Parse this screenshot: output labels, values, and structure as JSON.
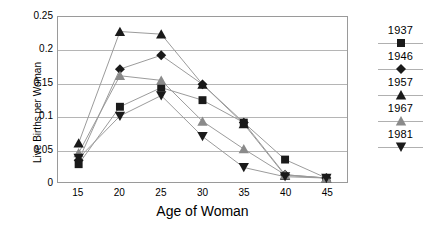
{
  "chart_data": {
    "type": "line",
    "title": "",
    "xlabel": "Age of Woman",
    "ylabel": "Live Births per Woman",
    "x": [
      15,
      20,
      25,
      30,
      35,
      40,
      45
    ],
    "xtick_labels": [
      "15",
      "20",
      "25",
      "30",
      "35",
      "40",
      "45"
    ],
    "ytick_labels": [
      "0",
      "0.05",
      "0.1",
      "0.15",
      "0.2",
      "0.25"
    ],
    "ytick_values": [
      0,
      0.05,
      0.1,
      0.15,
      0.2,
      0.25
    ],
    "xlim": [
      12.5,
      47.5
    ],
    "ylim": [
      0,
      0.25
    ],
    "grid": "horizontal",
    "legend_position": "right",
    "series": [
      {
        "name": "1937",
        "marker": "square",
        "color": "#1a1a1a",
        "values": [
          0.027,
          0.114,
          0.143,
          0.124,
          0.09,
          0.034,
          0.006
        ]
      },
      {
        "name": "1946",
        "marker": "diamond",
        "color": "#1a1a1a",
        "values": [
          0.033,
          0.171,
          0.192,
          0.148,
          0.09,
          0.011,
          0.006
        ]
      },
      {
        "name": "1957",
        "marker": "triangle-up",
        "color": "#1a1a1a",
        "values": [
          0.059,
          0.228,
          0.224,
          0.148,
          0.088,
          0.01,
          0.006
        ]
      },
      {
        "name": "1967",
        "marker": "triangle-up-gray",
        "color": "#8a8a8a",
        "values": [
          0.044,
          0.161,
          0.154,
          0.092,
          0.05,
          0.011,
          0.006
        ]
      },
      {
        "name": "1981",
        "marker": "triangle-down",
        "color": "#1a1a1a",
        "values": [
          0.036,
          0.1,
          0.131,
          0.069,
          0.022,
          0.008,
          0.006
        ]
      }
    ]
  },
  "legend": {
    "entries": [
      {
        "label": "1937"
      },
      {
        "label": "1946"
      },
      {
        "label": "1957"
      },
      {
        "label": "1967"
      },
      {
        "label": "1981"
      }
    ]
  },
  "colors": {
    "line": "#9a9a9a",
    "grid": "#b5b5b5",
    "frame": "#9a9a9a",
    "marker_dark": "#1a1a1a",
    "marker_gray": "#8a8a8a",
    "background": "#ffffff"
  }
}
